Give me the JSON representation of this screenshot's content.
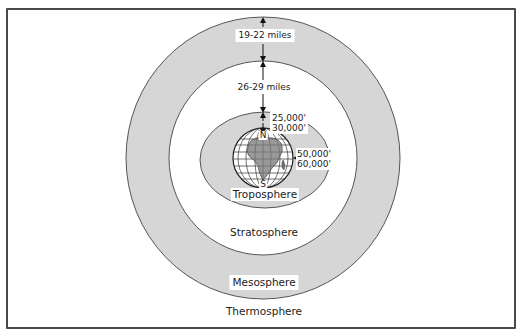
{
  "diagram": {
    "layers": [
      {
        "name": "Troposphere",
        "label": "Troposphere"
      },
      {
        "name": "Stratosphere",
        "label": "Stratosphere"
      },
      {
        "name": "Mesosphere",
        "label": "Mesosphere"
      },
      {
        "name": "Thermosphere",
        "label": "Thermosphere"
      }
    ],
    "measurements": {
      "mesosphere_thickness": "19-22 miles",
      "stratosphere_thickness": "26-29 miles",
      "troposphere_polar_top": "25,000'",
      "troposphere_polar_bottom": "30,000'",
      "troposphere_equator_top": "50,000'",
      "troposphere_equator_bottom": "60,000'"
    },
    "poles": {
      "north": "N",
      "south": "S"
    },
    "colors": {
      "band_fill": "#d6d6d6",
      "outline": "#555555",
      "frame": "#4a4a4a",
      "background": "#ffffff"
    }
  }
}
